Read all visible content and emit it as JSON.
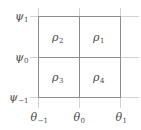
{
  "figure": {
    "kind": "grid-diagram",
    "width": 141,
    "height": 130,
    "background_color": "#ffffff",
    "line_color": "#8d8d8d",
    "light_line_color": "#d2d2d2",
    "text_color": "#4a4a4a"
  },
  "cells": [
    {
      "id": "top-left",
      "symbol": "ρ",
      "subscript": "2"
    },
    {
      "id": "top-right",
      "symbol": "ρ",
      "subscript": "1"
    },
    {
      "id": "bottom-left",
      "symbol": "ρ",
      "subscript": "3"
    },
    {
      "id": "bottom-right",
      "symbol": "ρ",
      "subscript": "4"
    }
  ],
  "y_axis": {
    "symbol": "ψ",
    "ticks": [
      {
        "symbol": "ψ",
        "subscript": "1"
      },
      {
        "symbol": "ψ",
        "subscript": "0"
      },
      {
        "symbol": "ψ",
        "subscript": "−1"
      }
    ]
  },
  "x_axis": {
    "symbol": "θ",
    "ticks": [
      {
        "symbol": "θ",
        "subscript": "−1"
      },
      {
        "symbol": "θ",
        "subscript": "0"
      },
      {
        "symbol": "θ",
        "subscript": "1"
      }
    ]
  }
}
